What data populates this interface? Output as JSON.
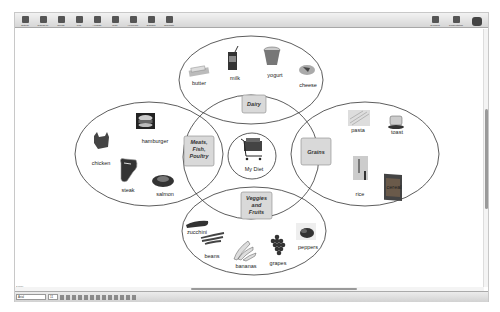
{
  "toolbar": {
    "buttons": [
      {
        "label": "Outline",
        "icon": "outline-icon"
      },
      {
        "label": "RapidFire",
        "icon": "rapidfire-icon"
      },
      {
        "label": "Create",
        "icon": "create-icon"
      },
      {
        "label": "Link",
        "icon": "link-icon"
      },
      {
        "label": "Arrange",
        "icon": "arrange-icon"
      },
      {
        "label": "Note",
        "icon": "note-icon"
      },
      {
        "label": "Hyperlink",
        "icon": "hyperlink-icon"
      },
      {
        "label": "Transfer",
        "icon": "transfer-icon"
      },
      {
        "label": "Template",
        "icon": "template-icon"
      }
    ],
    "right_buttons": [
      {
        "label": "Symbols",
        "icon": "symbols-icon"
      },
      {
        "label": "Presentation",
        "icon": "presentation-icon"
      },
      {
        "label": "Inspiration",
        "icon": "inspiration-logo-icon"
      }
    ]
  },
  "diagram": {
    "center": {
      "label": "My Diet",
      "icon": "shopping-cart-icon"
    },
    "categories": [
      {
        "id": "dairy",
        "label": "Dairy",
        "items": [
          {
            "label": "butter",
            "icon": "butter-icon"
          },
          {
            "label": "milk",
            "icon": "milk-carton-icon"
          },
          {
            "label": "yogurt",
            "icon": "yogurt-icon"
          },
          {
            "label": "cheese",
            "icon": "cheese-icon"
          }
        ]
      },
      {
        "id": "meats",
        "label_lines": [
          "Meats,",
          "Fish,",
          "Poultry"
        ],
        "items": [
          {
            "label": "hamburger",
            "icon": "hamburger-icon"
          },
          {
            "label": "chicken",
            "icon": "chicken-icon"
          },
          {
            "label": "steak",
            "icon": "steak-icon"
          },
          {
            "label": "salmon",
            "icon": "salmon-icon"
          }
        ]
      },
      {
        "id": "grains",
        "label": "Grains",
        "items": [
          {
            "label": "pasta",
            "icon": "pasta-icon"
          },
          {
            "label": "toast",
            "icon": "toaster-icon"
          },
          {
            "label": "rice",
            "icon": "rice-icon"
          },
          {
            "label": "cereal",
            "icon": "cereal-box-icon"
          }
        ]
      },
      {
        "id": "veggies",
        "label_lines": [
          "Veggies",
          "and",
          "Fruits"
        ],
        "items": [
          {
            "label": "zucchini",
            "icon": "zucchini-icon"
          },
          {
            "label": "beans",
            "icon": "beans-icon"
          },
          {
            "label": "bananas",
            "icon": "bananas-icon"
          },
          {
            "label": "grapes",
            "icon": "grapes-icon"
          },
          {
            "label": "peppers",
            "icon": "peppers-icon"
          }
        ]
      }
    ]
  },
  "statusbar": {
    "zoom": "100%",
    "font": "Arial",
    "font_size": "11"
  },
  "colors": {
    "category_box": "#d9d9d9",
    "line": "#333333"
  }
}
